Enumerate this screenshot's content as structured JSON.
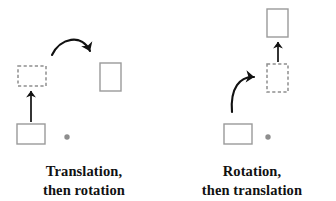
{
  "figure": {
    "type": "diagram",
    "background_color": "#ffffff",
    "shape_stroke_color": "#9a9a9a",
    "shape_fill_color": "#ffffff",
    "arrow_color": "#111111",
    "pivot_dot_color": "#8e8e8e",
    "text_color": "#111111"
  },
  "panels": [
    {
      "id": "translation-then-rotation",
      "caption_line1": "Translation,",
      "caption_line2": "then rotation",
      "shapes": [
        {
          "name": "start-square",
          "style": "solid",
          "orientation": "landscape",
          "x": 17,
          "y": 124,
          "w": 28,
          "h": 20
        },
        {
          "name": "intermediate-square",
          "style": "dashed",
          "orientation": "landscape",
          "x": 18,
          "y": 66,
          "w": 28,
          "h": 20
        },
        {
          "name": "final-square",
          "style": "solid",
          "orientation": "portrait",
          "x": 100,
          "y": 63,
          "w": 21,
          "h": 28
        }
      ],
      "pivot_dot": {
        "name": "pivot-dot",
        "cx": 67,
        "cy": 137,
        "r": 2.6
      },
      "arrows": [
        {
          "name": "translation-arrow",
          "kind": "straight",
          "label": "translation",
          "from_x": 31,
          "from_y": 122,
          "to_x": 31,
          "to_y": 89
        },
        {
          "name": "rotation-arrow",
          "kind": "curved",
          "label": "rotation",
          "from_x": 52,
          "from_y": 55,
          "ctrl_x": 72,
          "ctrl_y": 36,
          "to_x": 92,
          "to_y": 55
        }
      ]
    },
    {
      "id": "rotation-then-translation",
      "caption_line1": "Rotation,",
      "caption_line2": "then translation",
      "shapes": [
        {
          "name": "start-square",
          "style": "solid",
          "orientation": "landscape",
          "x": 56,
          "y": 124,
          "w": 28,
          "h": 20
        },
        {
          "name": "intermediate-square",
          "style": "dashed",
          "orientation": "portrait",
          "x": 99,
          "y": 64,
          "w": 21,
          "h": 28
        },
        {
          "name": "final-square",
          "style": "solid",
          "orientation": "portrait",
          "x": 99,
          "y": 9,
          "w": 21,
          "h": 28
        }
      ],
      "pivot_dot": {
        "name": "pivot-dot",
        "cx": 100,
        "cy": 137,
        "r": 2.6
      },
      "arrows": [
        {
          "name": "rotation-arrow",
          "kind": "curved",
          "label": "rotation",
          "from_x": 64,
          "from_y": 112,
          "ctrl_x": 66,
          "ctrl_y": 80,
          "to_x": 88,
          "to_y": 78
        },
        {
          "name": "translation-arrow",
          "kind": "straight",
          "label": "translation",
          "from_x": 110,
          "from_y": 62,
          "to_x": 110,
          "to_y": 40
        }
      ]
    }
  ]
}
